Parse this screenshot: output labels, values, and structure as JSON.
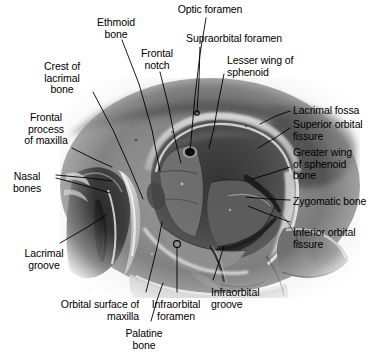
{
  "figure": {
    "kind": "anatomical-photograph-plate",
    "background_color": "#ffffff",
    "ink_color": "#000000"
  },
  "labels": [
    {
      "id": "optic-foramen",
      "text": "Optic foramen",
      "align": "center",
      "x": 210,
      "y": 4
    },
    {
      "id": "ethmoid-bone",
      "text": "Ethmoid\nbone",
      "align": "center",
      "x": 116,
      "y": 17
    },
    {
      "id": "supraorbital-foramen",
      "text": "Supraorbital foramen",
      "align": "left",
      "x": 186,
      "y": 33
    },
    {
      "id": "frontal-notch",
      "text": "Frontal\nnotch",
      "align": "center",
      "x": 157,
      "y": 48
    },
    {
      "id": "lesser-wing-sphenoid",
      "text": "Lesser wing of\nsphenoid",
      "align": "left",
      "x": 227,
      "y": 55
    },
    {
      "id": "crest-lacrimal-bone",
      "text": "Crest of\nlacrimal\nbone",
      "align": "center",
      "x": 62,
      "y": 61
    },
    {
      "id": "lacrimal-fossa",
      "text": "Lacrimal fossa",
      "align": "left",
      "x": 293,
      "y": 105
    },
    {
      "id": "superior-orbital-fissure",
      "text": "Superior orbital\nfissure",
      "align": "left",
      "x": 293,
      "y": 119
    },
    {
      "id": "frontal-process-maxilla",
      "text": "Frontal\nprocess\nof maxilla",
      "align": "center",
      "x": 46,
      "y": 112
    },
    {
      "id": "greater-wing-sphenoid",
      "text": "Greater wing\nof sphenoid\nbone",
      "align": "left",
      "x": 293,
      "y": 147
    },
    {
      "id": "nasal-bones",
      "text": "Nasal\nbones",
      "align": "center",
      "x": 27,
      "y": 171
    },
    {
      "id": "zygomatic-bone",
      "text": "Zygomatic bone",
      "align": "left",
      "x": 293,
      "y": 196
    },
    {
      "id": "inferior-orbital-fissure",
      "text": "Inferior orbital\nfissure",
      "align": "left",
      "x": 293,
      "y": 227
    },
    {
      "id": "lacrimal-groove",
      "text": "Lacrimal\ngroove",
      "align": "center",
      "x": 44,
      "y": 248
    },
    {
      "id": "infraorbital-groove",
      "text": "Infraorbital\ngroove",
      "align": "left",
      "x": 211,
      "y": 287
    },
    {
      "id": "orbital-surface-maxilla",
      "text": "Orbital surface of\nmaxilla",
      "align": "right",
      "x": 139,
      "y": 299
    },
    {
      "id": "infraorbital-foramen",
      "text": "Infraorbital\nforamen",
      "align": "center",
      "x": 176,
      "y": 299
    },
    {
      "id": "palatine-bone",
      "text": "Palatine\nbone",
      "align": "center",
      "x": 144,
      "y": 328
    }
  ],
  "leaders": [
    {
      "id": "optic-foramen",
      "points": "206,18 200,54 195,96 190,152"
    },
    {
      "id": "ethmoid-bone",
      "points": "122,40 139,84 152,130 160,171"
    },
    {
      "id": "supraorbital-foramen",
      "points": "200,47 199,80 197,112"
    },
    {
      "id": "frontal-notch",
      "points": "160,72 168,104 175,139 181,163"
    },
    {
      "id": "lesser-wing-sphenoid",
      "points": "224,74 218,104 214,128 209,148"
    },
    {
      "id": "crest-lacrimal-bone",
      "points": "93,92 113,130 130,168 143,199"
    },
    {
      "id": "lacrimal-fossa",
      "points": "290,111 276,116 260,124"
    },
    {
      "id": "superior-orbital-fissure",
      "points": "290,128 275,138 258,148"
    },
    {
      "id": "greater-wing-sphenoid",
      "points": "290,167 272,173 252,179"
    },
    {
      "id": "frontal-process-maxilla",
      "points": "72,148 94,159 112,167"
    },
    {
      "id": "nasal-bones-a",
      "points": "56,175 88,178 112,181"
    },
    {
      "id": "nasal-bones-b",
      "points": "56,178 86,186 110,193"
    },
    {
      "id": "zygomatic-bone",
      "points": "290,200 268,199 246,197"
    },
    {
      "id": "inferior-orbital-fissure",
      "points": "290,222 268,214 248,206"
    },
    {
      "id": "lacrimal-groove",
      "points": "60,243 86,228 106,215"
    },
    {
      "id": "infraorbital-groove",
      "points": "213,280 219,262 224,246"
    },
    {
      "id": "orbital-surface-maxilla",
      "points": "146,292 152,268 158,243 162,222"
    },
    {
      "id": "infraorbital-foramen",
      "points": "177,292 177,268 177,248"
    },
    {
      "id": "palatine-bone",
      "points": "151,321 157,300 163,283"
    }
  ],
  "markers": [
    {
      "id": "optic-foramen-marker",
      "cx": 190,
      "cy": 152,
      "r": 2.6
    },
    {
      "id": "supraorbital-foramen-marker",
      "cx": 197,
      "cy": 113,
      "r": 2.2
    },
    {
      "id": "infraorbital-foramen-marker",
      "cx": 177,
      "cy": 244,
      "r": 3.4
    }
  ]
}
